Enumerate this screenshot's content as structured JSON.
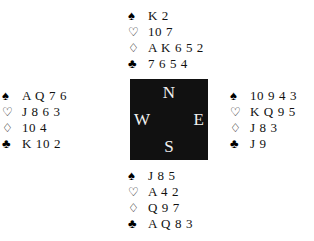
{
  "diagram": {
    "type": "bridge-hand-diagram",
    "background_color": "#ffffff",
    "compass_box_color": "#111111",
    "compass_label_color": "#f2f2f2"
  },
  "suits": {
    "spade": {
      "name": "spade-symbol",
      "glyph": "♠",
      "filled": true
    },
    "heart": {
      "name": "heart-symbol",
      "glyph": "♡",
      "filled": false
    },
    "diamond": {
      "name": "diamond-symbol",
      "glyph": "♢",
      "filled": false
    },
    "club": {
      "name": "club-symbol",
      "glyph": "♣",
      "filled": true
    }
  },
  "compass": {
    "north": "N",
    "west": "W",
    "east": "E",
    "south": "S"
  },
  "hands": {
    "north": {
      "position": "North",
      "spades": "K 2",
      "hearts": "10 7",
      "diamonds": "A K 6 5 2",
      "clubs": "7 6 5 4"
    },
    "west": {
      "position": "West",
      "spades": "A Q 7 6",
      "hearts": "J 8 6 3",
      "diamonds": "10 4",
      "clubs": "K 10 2"
    },
    "east": {
      "position": "East",
      "spades": "10 9 4 3",
      "hearts": "K Q 9 5",
      "diamonds": "J 8 3",
      "clubs": "J 9"
    },
    "south": {
      "position": "South",
      "spades": "J 8 5",
      "hearts": "A 4 2",
      "diamonds": "Q 9 7",
      "clubs": "A Q 8 3"
    }
  }
}
